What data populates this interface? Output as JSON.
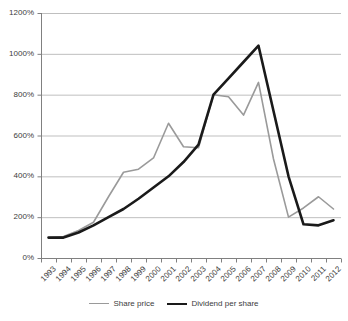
{
  "chart_data": {
    "type": "line",
    "title": "",
    "subtitle": "",
    "xlabel": "",
    "ylabel": "",
    "categories": [
      "1993",
      "1994",
      "1995",
      "1996",
      "1997",
      "1998",
      "1999",
      "2000",
      "2001",
      "2002",
      "2003",
      "2004",
      "2005",
      "2006",
      "2007",
      "2008",
      "2009",
      "2010",
      "2011",
      "2012"
    ],
    "ylim": [
      0,
      1200
    ],
    "ytick_values": [
      0,
      200,
      400,
      600,
      800,
      1000,
      1200
    ],
    "ytick_labels": [
      "0%",
      "200%",
      "400%",
      "600%",
      "800%",
      "1000%",
      "1200%"
    ],
    "grid": "horizontal",
    "legend_position": "bottom",
    "series": [
      {
        "name": "Share price",
        "color": "#9a9a9a",
        "width": 1.6,
        "values": [
          100,
          105,
          135,
          175,
          300,
          420,
          435,
          490,
          660,
          545,
          540,
          800,
          790,
          700,
          860,
          485,
          200,
          245,
          300,
          240
        ]
      },
      {
        "name": "Dividend per share",
        "color": "#1a1a1a",
        "width": 2.6,
        "values": [
          100,
          100,
          125,
          160,
          200,
          240,
          290,
          345,
          400,
          470,
          555,
          800,
          880,
          960,
          1040,
          720,
          400,
          165,
          160,
          185
        ]
      }
    ]
  },
  "legend": {
    "items": [
      {
        "label": "Share price"
      },
      {
        "label": "Dividend per share"
      }
    ]
  },
  "axis": {
    "axis_color": "#808080",
    "grid_color": "#bfbfbf",
    "text_color": "#3c3c3c"
  }
}
